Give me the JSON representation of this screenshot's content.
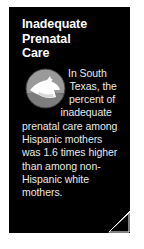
{
  "card": {
    "title": "Inadequate\nPrenatal\nCare",
    "body": "In South Texas, the percent of inadequate prenatal care among Hispanic mothers was 1.6 times higher than among non-Hispanic white mothers.",
    "statistic": "1.6 times",
    "region": "South Texas",
    "background_color": "#000000",
    "title_color": "#ffffff",
    "body_color": "#eaeaea",
    "page_background": "#ffffff"
  },
  "icon": {
    "name": "stork-arrow-circle-icon",
    "circle_color": "#9a9a9a",
    "circle_shadow_color": "#5e5e5e",
    "arrow_color": "#ffffff",
    "accent_color": "#cfcfcf"
  },
  "page_curl": {
    "name": "page-curl-fold",
    "fold_color": "#ffffff",
    "outline_color": "#ffffff"
  }
}
